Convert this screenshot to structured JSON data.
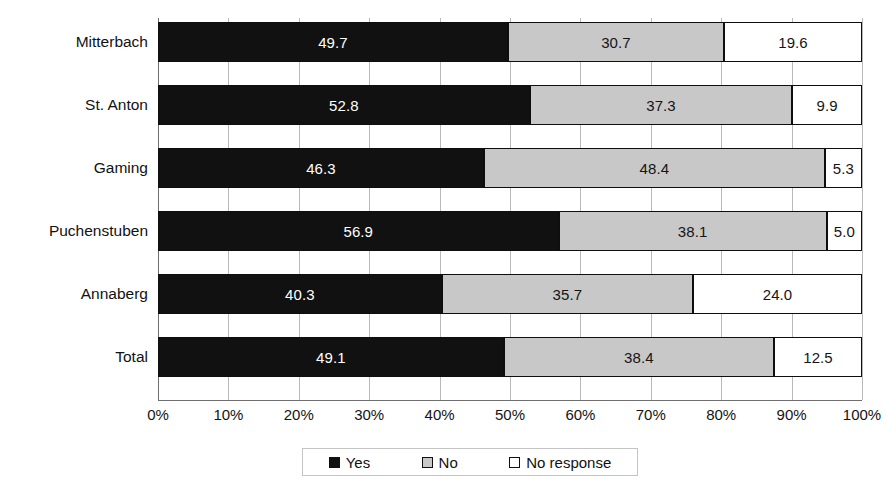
{
  "chart_data": {
    "type": "bar",
    "orientation": "horizontal",
    "stacked": true,
    "stacked_normalized": true,
    "title": "",
    "subtitle": "",
    "xlabel": "",
    "ylabel": "",
    "xlim": [
      0,
      100
    ],
    "grid": true,
    "legend_position": "bottom",
    "categories": [
      "Mitterbach",
      "St. Anton",
      "Gaming",
      "Puchenstuben",
      "Annaberg",
      "Total"
    ],
    "series": [
      {
        "name": "Yes",
        "color": "#111111",
        "values": [
          49.7,
          52.8,
          46.3,
          56.9,
          40.3,
          49.1
        ]
      },
      {
        "name": "No",
        "color": "#c8c8c8",
        "values": [
          30.7,
          37.3,
          48.4,
          38.1,
          35.7,
          38.4
        ]
      },
      {
        "name": "No response",
        "color": "#ffffff",
        "values": [
          19.6,
          9.9,
          5.3,
          5.0,
          24.0,
          12.5
        ]
      }
    ],
    "xticks": [
      0,
      10,
      20,
      30,
      40,
      50,
      60,
      70,
      80,
      90,
      100
    ],
    "xtick_labels": [
      "0%",
      "10%",
      "20%",
      "30%",
      "40%",
      "50%",
      "60%",
      "70%",
      "80%",
      "90%",
      "100%"
    ],
    "data_label_format": "one_decimal",
    "rows": [
      {
        "category": "Mitterbach",
        "yes": "49.7",
        "no": "30.7",
        "no_response": "19.6"
      },
      {
        "category": "St. Anton",
        "yes": "52.8",
        "no": "37.3",
        "no_response": "9.9"
      },
      {
        "category": "Gaming",
        "yes": "46.3",
        "no": "48.4",
        "no_response": "5.3"
      },
      {
        "category": "Puchenstuben",
        "yes": "56.9",
        "no": "38.1",
        "no_response": "5.0"
      },
      {
        "category": "Annaberg",
        "yes": "40.3",
        "no": "35.7",
        "no_response": "24.0"
      },
      {
        "category": "Total",
        "yes": "49.1",
        "no": "38.4",
        "no_response": "12.5"
      }
    ]
  },
  "legend": {
    "items": [
      {
        "label": "Yes",
        "swatch": "swatch-black"
      },
      {
        "label": "No",
        "swatch": "swatch-gray"
      },
      {
        "label": "No response",
        "swatch": "swatch-white"
      }
    ]
  },
  "colors": {
    "yes": "#111111",
    "no": "#c8c8c8",
    "no_response": "#ffffff",
    "gridline": "#b9b9b9",
    "axis": "#6f6f6f",
    "background": "#ffffff"
  }
}
